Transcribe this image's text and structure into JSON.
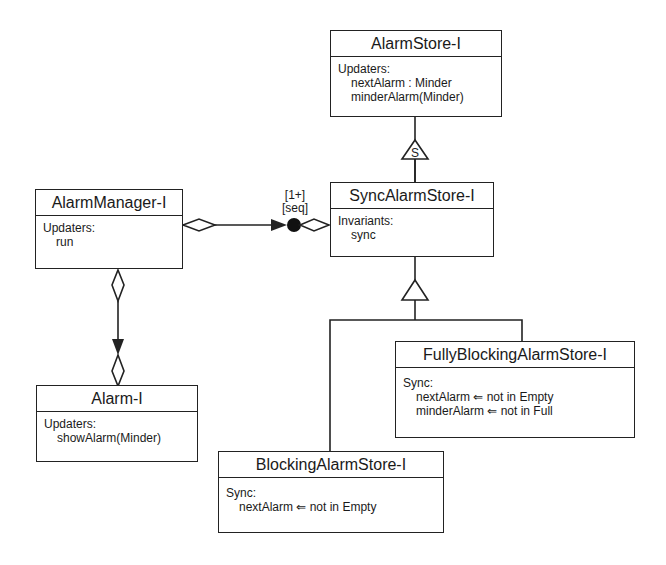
{
  "classes": {
    "alarm_store": {
      "name": "AlarmStore-I",
      "section": "Updaters:",
      "entries": [
        "nextAlarm : Minder",
        "minderAlarm(Minder)"
      ]
    },
    "alarm_manager": {
      "name": "AlarmManager-I",
      "section": "Updaters:",
      "entries": [
        "run"
      ]
    },
    "sync_alarm_store": {
      "name": "SyncAlarmStore-I",
      "section": "Invariants:",
      "entries": [
        "sync"
      ]
    },
    "alarm": {
      "name": "Alarm-I",
      "section": "Updaters:",
      "entries": [
        "showAlarm(Minder)"
      ]
    },
    "fully_blocking": {
      "name": "FullyBlockingAlarmStore-I",
      "section": "Sync:",
      "entries": [
        "nextAlarm ⇐ not in Empty",
        "minderAlarm ⇐ not in Full"
      ]
    },
    "blocking": {
      "name": "BlockingAlarmStore-I",
      "section": "Sync:",
      "entries": [
        "nextAlarm ⇐ not in Empty"
      ]
    }
  },
  "relations": {
    "sync_specialization_marker": "S",
    "manager_store_multiplicity": "[1+]",
    "manager_store_ordering": "[seq]"
  },
  "colors": {
    "line": "#222222",
    "background": "#ffffff"
  }
}
